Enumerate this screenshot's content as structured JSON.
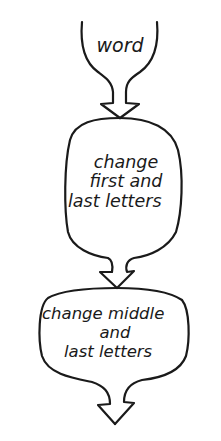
{
  "diagram": {
    "type": "flowchart",
    "style": "hand-drawn",
    "nodes": [
      {
        "id": "word",
        "lines": [
          "word"
        ]
      },
      {
        "id": "change-first-last",
        "lines": [
          "change",
          "first and",
          "last letters"
        ]
      },
      {
        "id": "change-middle-last",
        "lines": [
          "change middle",
          "and",
          "last letters"
        ]
      }
    ],
    "edges": [
      {
        "from": "word",
        "to": "change-first-last"
      },
      {
        "from": "change-first-last",
        "to": "change-middle-last"
      },
      {
        "from": "change-middle-last",
        "to": "output"
      }
    ],
    "colors": {
      "stroke": "#1a1a1a",
      "background": "#ffffff"
    }
  }
}
